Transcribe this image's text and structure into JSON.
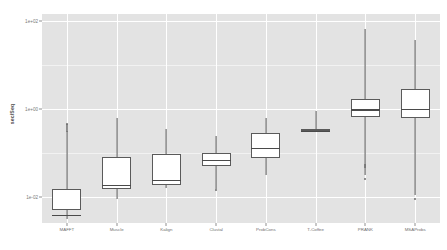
{
  "chart_data": {
    "type": "box",
    "title": "",
    "xlabel": "",
    "ylabel": "sec/Seq",
    "yscale": "log10",
    "ylim": [
      -2.6,
      2.15
    ],
    "grid": true,
    "legend": "none",
    "y_ticks": [
      {
        "label": "1e+02",
        "value": 2
      },
      {
        "label": "1e+00",
        "value": 0
      },
      {
        "label": "1e-02",
        "value": -2
      }
    ],
    "y_minor_ticks": [
      1,
      -1
    ],
    "categories": [
      "MAFFT",
      "Muscle",
      "Kalign",
      "Clustal",
      "ProbCons",
      "T-Coffee",
      "PRANK",
      "MSAProbs"
    ],
    "boxes": [
      {
        "category": "MAFFT",
        "lower_whisker": -2.52,
        "q1": -2.3,
        "median": -2.42,
        "q3": -1.82,
        "upper_whisker": -0.52,
        "outliers": [
          -0.5,
          -0.46,
          -0.42,
          -0.38,
          -0.34
        ]
      },
      {
        "category": "Muscle",
        "lower_whisker": -2.05,
        "q1": -1.82,
        "median": -1.74,
        "q3": -1.1,
        "upper_whisker": -0.22,
        "outliers": []
      },
      {
        "category": "Kalign",
        "lower_whisker": -1.8,
        "q1": -1.74,
        "median": -1.62,
        "q3": -1.03,
        "upper_whisker": -0.46,
        "outliers": []
      },
      {
        "category": "Clustal",
        "lower_whisker": -1.83,
        "q1": -1.3,
        "median": -1.17,
        "q3": -1.02,
        "upper_whisker": -0.63,
        "outliers": [
          -1.86
        ]
      },
      {
        "category": "ProbCons",
        "lower_whisker": -1.5,
        "q1": -1.12,
        "median": -0.9,
        "q3": -0.56,
        "upper_whisker": -0.22,
        "outliers": []
      },
      {
        "category": "T-Coffee",
        "lower_whisker": -0.52,
        "q1": -0.52,
        "median": -0.5,
        "q3": -0.47,
        "upper_whisker": -0.05,
        "outliers": []
      },
      {
        "category": "PRANK",
        "lower_whisker": -1.5,
        "q1": -0.2,
        "median": -0.02,
        "q3": 0.22,
        "upper_whisker": 1.8,
        "outliers": [
          -1.6,
          -1.33,
          -1.28
        ]
      },
      {
        "category": "MSAProbs",
        "lower_whisker": -1.97,
        "q1": -0.22,
        "median": 0.0,
        "q3": 0.44,
        "upper_whisker": 1.55,
        "outliers": [
          -2.05
        ]
      }
    ]
  }
}
